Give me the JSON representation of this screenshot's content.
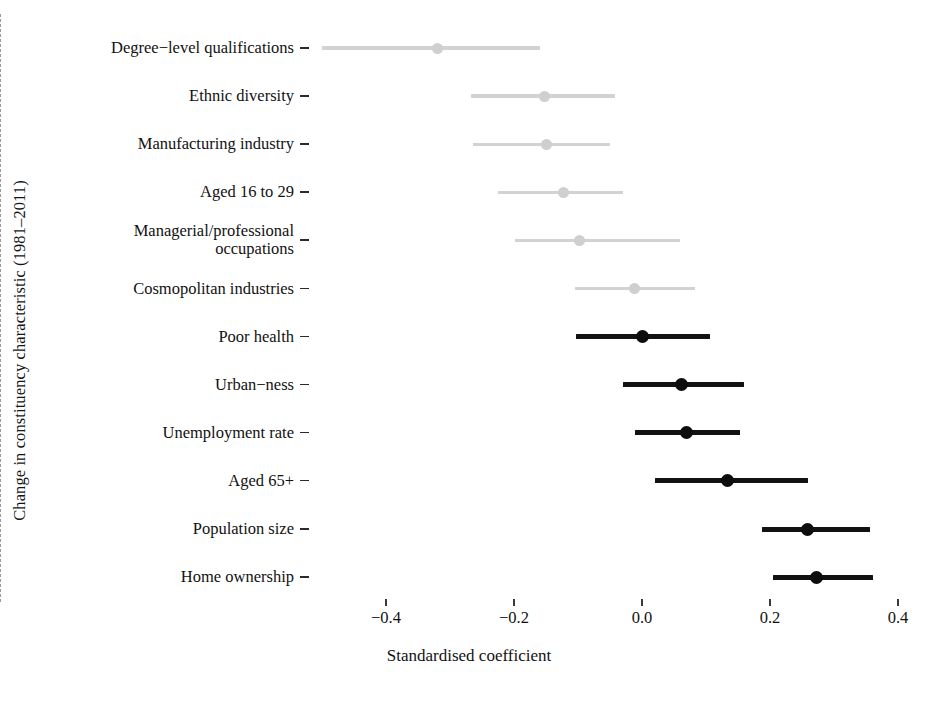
{
  "chart_data": {
    "type": "scatter",
    "subtype": "coefficient-forest-plot",
    "title": "",
    "xlabel": "Standardised coefficient",
    "ylabel": "Change in constituency characteristic (1981–2011)",
    "xlim": [
      -0.52,
      0.46
    ],
    "xticks": [
      -0.4,
      -0.2,
      0.0,
      0.2,
      0.4
    ],
    "xtick_labels": [
      "−0.4",
      "−0.2",
      "0.0",
      "0.2",
      "0.4"
    ],
    "grid": false,
    "legend": null,
    "reference_line": {
      "x": 0.0,
      "style": "dashed",
      "color": "#9a9a9a"
    },
    "colors": {
      "significant": "#0d0d0d",
      "not_significant": "#d2d2d2",
      "axis": "#111111",
      "background": "#ffffff"
    },
    "categories": [
      "Degree−level qualifications",
      "Ethnic diversity",
      "Manufacturing industry",
      "Aged 16 to 29",
      "Managerial/professional\noccupations",
      "Cosmopolitan industries",
      "Poor health",
      "Urban−ness",
      "Unemployment rate",
      "Aged 65+",
      "Population size",
      "Home ownership"
    ],
    "points": [
      {
        "label": "Degree−level qualifications",
        "estimate": -0.319,
        "low": -0.5,
        "high": -0.159,
        "significant": false
      },
      {
        "label": "Ethnic diversity",
        "estimate": -0.152,
        "low": -0.267,
        "high": -0.042,
        "significant": false
      },
      {
        "label": "Manufacturing industry",
        "estimate": -0.15,
        "low": -0.264,
        "high": -0.05,
        "significant": false
      },
      {
        "label": "Aged 16 to 29",
        "estimate": -0.123,
        "low": -0.225,
        "high": -0.03,
        "significant": false
      },
      {
        "label": "Managerial/professional\noccupations",
        "estimate": -0.097,
        "low": -0.198,
        "high": 0.06,
        "significant": false
      },
      {
        "label": "Cosmopolitan industries",
        "estimate": -0.011,
        "low": -0.105,
        "high": 0.083,
        "significant": false
      },
      {
        "label": "Poor health",
        "estimate": 0.0,
        "low": -0.103,
        "high": 0.106,
        "significant": true
      },
      {
        "label": "Urban−ness",
        "estimate": 0.061,
        "low": -0.03,
        "high": 0.159,
        "significant": true
      },
      {
        "label": "Unemployment rate",
        "estimate": 0.07,
        "low": -0.011,
        "high": 0.153,
        "significant": true
      },
      {
        "label": "Aged 65+",
        "estimate": 0.133,
        "low": 0.02,
        "high": 0.259,
        "significant": true
      },
      {
        "label": "Population size",
        "estimate": 0.259,
        "low": 0.188,
        "high": 0.356,
        "significant": true
      },
      {
        "label": "Home ownership",
        "estimate": 0.273,
        "low": 0.205,
        "high": 0.361,
        "significant": true
      }
    ]
  },
  "axes": {
    "x_title": "Standardised coefficient",
    "y_title": "Change in constituency characteristic (1981–2011)"
  }
}
